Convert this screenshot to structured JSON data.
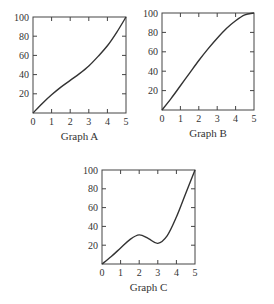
{
  "chart_data": [
    {
      "type": "line",
      "title": "Graph A",
      "xlabel": "",
      "ylabel": "",
      "x_ticks": [
        0,
        1,
        2,
        3,
        4,
        5
      ],
      "y_ticks": [
        20,
        40,
        60,
        80,
        100
      ],
      "xlim": [
        0,
        5
      ],
      "ylim": [
        0,
        100
      ],
      "grid": false,
      "x": [
        0,
        0.5,
        1,
        1.5,
        2,
        2.5,
        3,
        3.5,
        4,
        4.5,
        5
      ],
      "values": [
        0,
        10,
        19,
        27,
        34,
        41,
        49,
        59,
        70,
        84,
        100
      ]
    },
    {
      "type": "line",
      "title": "Graph B",
      "xlabel": "",
      "ylabel": "",
      "x_ticks": [
        0,
        1,
        2,
        3,
        4,
        5
      ],
      "y_ticks": [
        20,
        40,
        60,
        80,
        100
      ],
      "xlim": [
        0,
        5
      ],
      "ylim": [
        0,
        100
      ],
      "grid": false,
      "x": [
        0,
        0.5,
        1,
        1.5,
        2,
        2.5,
        3,
        3.5,
        4,
        4.5,
        5
      ],
      "values": [
        0,
        12,
        25,
        38,
        51,
        63,
        74,
        84,
        92,
        98,
        100
      ]
    },
    {
      "type": "line",
      "title": "Graph C",
      "xlabel": "",
      "ylabel": "",
      "x_ticks": [
        0,
        1,
        2,
        3,
        4,
        5
      ],
      "y_ticks": [
        20,
        40,
        60,
        80,
        100
      ],
      "xlim": [
        0,
        5
      ],
      "ylim": [
        0,
        100
      ],
      "grid": false,
      "x": [
        0,
        0.5,
        1,
        1.5,
        2,
        2.5,
        3,
        3.5,
        4,
        4.5,
        5
      ],
      "values": [
        0,
        8,
        17,
        26,
        31,
        27,
        22,
        30,
        50,
        75,
        100
      ]
    }
  ],
  "captions": {
    "a": "Graph A",
    "b": "Graph B",
    "c": "Graph C"
  },
  "line_color": "#333333"
}
